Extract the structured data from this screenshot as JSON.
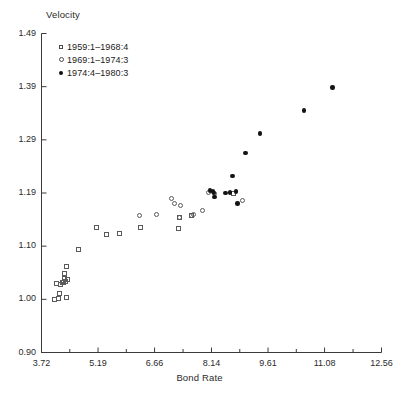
{
  "chart_data": {
    "type": "scatter",
    "title": "",
    "ylabel": "Velocity",
    "xlabel": "Bond Rate",
    "xlim": [
      3.72,
      12.56
    ],
    "ylim": [
      0.9,
      1.49
    ],
    "grid": false,
    "legend_position": "top-left",
    "xticks": [
      "3.72",
      "5.19",
      "6.66",
      "8.14",
      "9.61",
      "11.08",
      "12.56"
    ],
    "xtick_values": [
      3.72,
      5.19,
      6.66,
      8.14,
      9.61,
      11.08,
      12.56
    ],
    "yticks": [
      "1.49",
      "1.39",
      "1.29",
      "1.19",
      "1.10",
      "1.00",
      "0.90"
    ],
    "ytick_values": [
      1.49,
      1.39,
      1.29,
      1.19,
      1.1,
      1.0,
      0.9
    ],
    "minor_xticks": true,
    "series": [
      {
        "name": "1959:1–1968:4",
        "marker": "open-square",
        "color": "#5a5a5a",
        "points": [
          [
            4.05,
            1.0
          ],
          [
            4.15,
            1.002
          ],
          [
            4.37,
            1.003
          ],
          [
            4.2,
            1.011
          ],
          [
            4.21,
            1.027
          ],
          [
            4.12,
            1.03
          ],
          [
            4.26,
            1.032
          ],
          [
            4.3,
            1.032
          ],
          [
            4.34,
            1.034
          ],
          [
            4.31,
            1.04
          ],
          [
            4.4,
            1.037
          ],
          [
            4.33,
            1.048
          ],
          [
            4.36,
            1.061
          ],
          [
            4.68,
            1.094
          ],
          [
            5.16,
            1.132
          ],
          [
            5.4,
            1.12
          ],
          [
            5.75,
            1.121
          ],
          [
            6.3,
            1.132
          ],
          [
            7.28,
            1.13
          ],
          [
            7.3,
            1.148
          ],
          [
            7.62,
            1.152
          ],
          [
            8.72,
            1.19
          ]
        ]
      },
      {
        "name": "1969:1–1974:3",
        "marker": "open-circle",
        "color": "#5a5a5a",
        "points": [
          [
            6.28,
            1.152
          ],
          [
            6.72,
            1.153
          ],
          [
            7.1,
            1.18
          ],
          [
            7.17,
            1.173
          ],
          [
            7.33,
            1.168
          ],
          [
            7.3,
            1.148
          ],
          [
            7.62,
            1.152
          ],
          [
            7.68,
            1.154
          ],
          [
            7.9,
            1.161
          ],
          [
            8.06,
            1.191
          ],
          [
            8.22,
            1.19
          ],
          [
            8.94,
            1.178
          ]
        ]
      },
      {
        "name": "1974:4–1980:3",
        "marker": "filled-circle",
        "color": "#141414",
        "points": [
          [
            8.1,
            1.195
          ],
          [
            8.18,
            1.193
          ],
          [
            8.2,
            1.19
          ],
          [
            8.22,
            1.183
          ],
          [
            8.5,
            1.19
          ],
          [
            8.62,
            1.191
          ],
          [
            8.68,
            1.222
          ],
          [
            8.78,
            1.193
          ],
          [
            8.82,
            1.172
          ],
          [
            9.02,
            1.265
          ],
          [
            9.4,
            1.302
          ],
          [
            10.55,
            1.345
          ],
          [
            11.28,
            1.388
          ]
        ]
      }
    ]
  },
  "axes": {
    "y_title": "Velocity",
    "x_title": "Bond Rate"
  },
  "legend": {
    "items": [
      {
        "marker": "open-square",
        "label": "1959:1–1968:4"
      },
      {
        "marker": "open-circle",
        "label": "1969:1–1974:3"
      },
      {
        "marker": "filled-circle",
        "label": "1974:4–1980:3"
      }
    ]
  }
}
